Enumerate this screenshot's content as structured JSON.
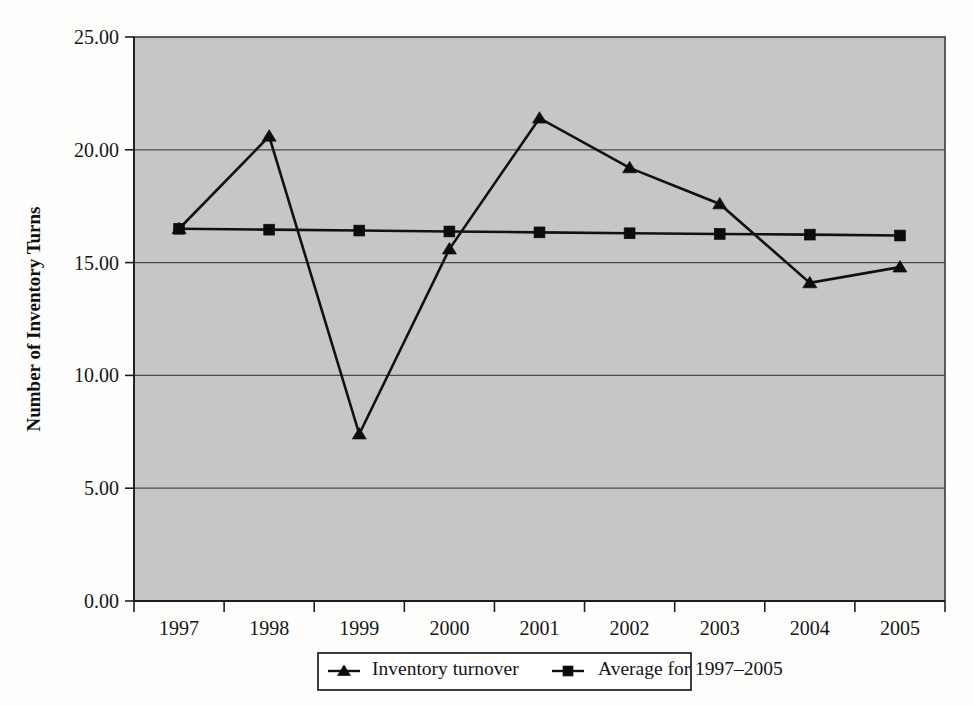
{
  "chart_data": {
    "type": "line",
    "title": "",
    "xlabel": "",
    "ylabel": "Number of Inventory Turns",
    "categories": [
      "1997",
      "1998",
      "1999",
      "2000",
      "2001",
      "2002",
      "2003",
      "2004",
      "2005"
    ],
    "ylim": [
      0,
      25
    ],
    "ytick_step": 5,
    "ytick_labels": [
      "0.00",
      "5.00",
      "10.00",
      "15.00",
      "20.00",
      "25.00"
    ],
    "ytick_values": [
      0,
      5,
      10,
      15,
      20,
      25
    ],
    "grid": true,
    "grid_axis": "y",
    "legend_position": "bottom",
    "series": [
      {
        "name": "Inventory turnover",
        "marker": "triangle",
        "values": [
          16.5,
          20.6,
          7.4,
          15.6,
          21.4,
          19.2,
          17.6,
          14.1,
          14.8
        ]
      },
      {
        "name": "Average for 1997–2005",
        "marker": "square",
        "values": [
          16.5,
          16.46,
          16.42,
          16.38,
          16.34,
          16.3,
          16.27,
          16.24,
          16.2
        ]
      }
    ],
    "colors": {
      "plot_background": "#c6c6c6",
      "page_background": "#fdfdfc",
      "series_line": "#111111",
      "marker": "#0c0c0c",
      "gridline": "#4a4a4a",
      "axis": "#1d1d1d",
      "legend_background": "#ffffff"
    }
  },
  "legend": {
    "items": [
      {
        "label": "Inventory turnover",
        "marker": "triangle"
      },
      {
        "label": "Average for 1997–2005",
        "marker": "square"
      }
    ]
  },
  "axes": {
    "y_title": "Number of Inventory Turns",
    "y_labels": [
      "25.00",
      "20.00",
      "15.00",
      "10.00",
      "5.00",
      "0.00"
    ],
    "x_labels": [
      "1997",
      "1998",
      "1999",
      "2000",
      "2001",
      "2002",
      "2003",
      "2004",
      "2005"
    ]
  }
}
